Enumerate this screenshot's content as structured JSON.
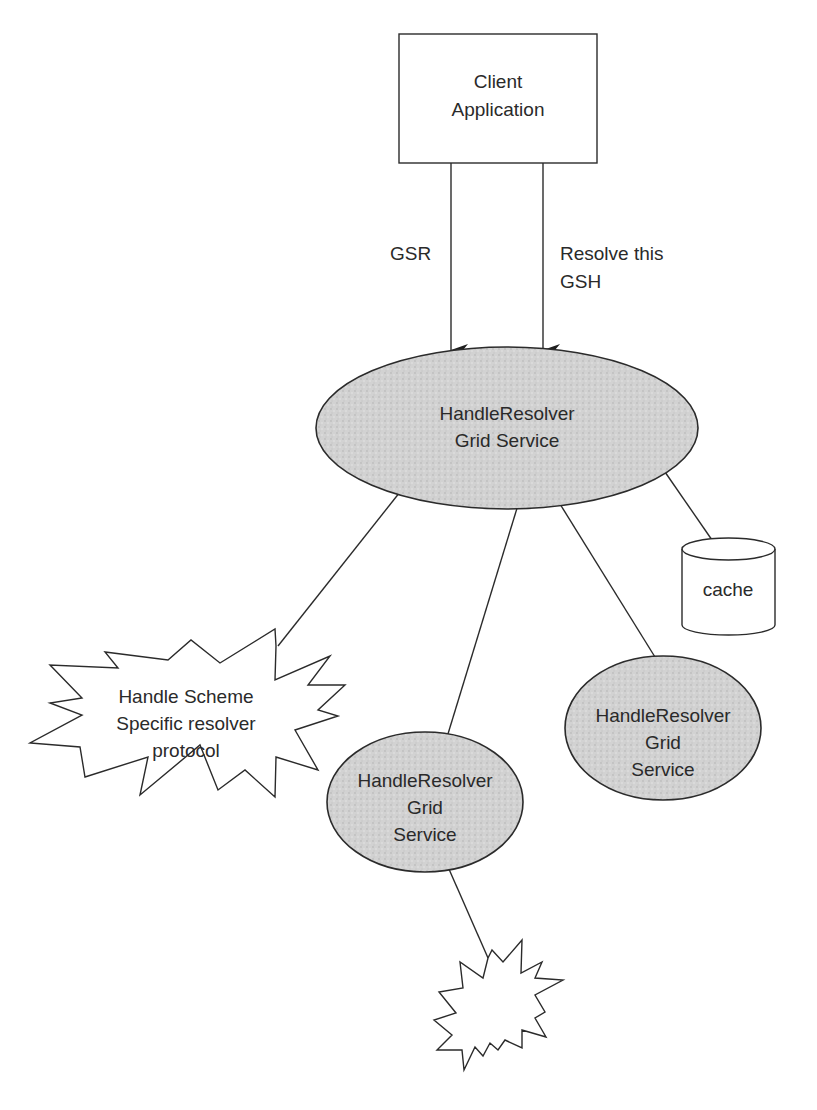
{
  "diagram": {
    "client": {
      "line1": "Client",
      "line2": "Application"
    },
    "arrows": {
      "left_label": "GSR",
      "right_label_line1": "Resolve this",
      "right_label_line2": "GSH"
    },
    "main_service": {
      "line1": "HandleResolver",
      "line2": "Grid Service"
    },
    "cache": {
      "label": "cache"
    },
    "scheme_protocol": {
      "line1": "Handle Scheme",
      "line2": "Specific resolver",
      "line3": "protocol"
    },
    "sub_service_left": {
      "line1": "HandleResolver",
      "line2": "Grid",
      "line3": "Service"
    },
    "sub_service_right": {
      "line1": "HandleResolver",
      "line2": "Grid",
      "line3": "Service"
    },
    "colors": {
      "line": "#2b2b2b",
      "ellipse_fill": "#cfcfcf",
      "background": "#ffffff"
    }
  }
}
